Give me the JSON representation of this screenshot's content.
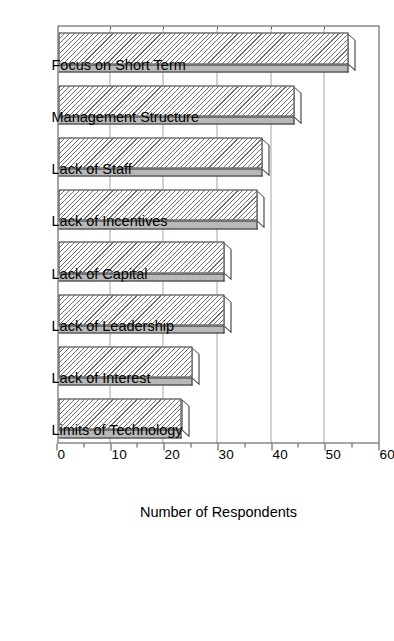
{
  "chart_data": {
    "type": "bar",
    "orientation": "vertical-rotated",
    "title": "",
    "subtitle": "",
    "xlabel": "",
    "ylabel": "Number of Respondents",
    "ylim": [
      0,
      60
    ],
    "ytick_step": 10,
    "yminor_step": 5,
    "grid": true,
    "grid_axis": "y",
    "gridline_values": [
      10,
      20,
      30,
      40,
      50
    ],
    "legend": null,
    "legend_position": "none",
    "categories": [
      "Focus on Short Term",
      "Management Structure",
      "Lack of Staff",
      "Lack of Incentives",
      "Lack of Capital",
      "Lack of Leadership",
      "Lack of Interest",
      "Limits of Technology"
    ],
    "values": [
      54,
      44,
      38,
      37,
      31,
      31,
      25,
      23
    ],
    "tick_labels": [
      "0",
      "10",
      "20",
      "30",
      "40",
      "50",
      "60"
    ],
    "tick_values": [
      0,
      10,
      20,
      30,
      40,
      50,
      60
    ],
    "minor_tick_values": [
      5,
      15,
      25,
      35,
      45,
      55
    ],
    "bar_style": {
      "fill": "hatched-diagonal",
      "hatch_color": "#6e6e6e",
      "face_color": "#ffffff",
      "side_color": "#b8b8b8",
      "edge_color": "#2b2b2b",
      "three_d": true
    }
  },
  "axis": {
    "value_axis_title": "Number of Respondents"
  },
  "figure": {
    "background": "#ffffff",
    "frame_color": "#4d4d4d"
  }
}
